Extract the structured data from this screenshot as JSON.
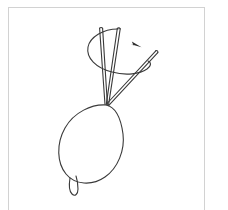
{
  "figure": {
    "title": "Hand-drawn line diagram of a looped cord with converging needles and a rotation arrow",
    "background_color": "#ffffff",
    "frame": {
      "name": "figure-border",
      "stroke_color": "#d2d2d2",
      "stroke_width": 1,
      "x": 8,
      "y": 7,
      "width": 197,
      "height": 210
    },
    "ink_color": "#3a3a3a",
    "ink_color_dark": "#2b2b2b",
    "stroke_width": 1.1,
    "elements": [
      {
        "name": "main-oval-loop",
        "type": "closed-curve",
        "description": "large tilted oval loop forming the body of the cord loop",
        "center_x": 92,
        "center_y": 142,
        "radius_x": 31,
        "radius_y": 41,
        "rotation_deg": 25
      },
      {
        "name": "small-tail-loop",
        "type": "closed-curve",
        "description": "small teardrop loop hanging below the main oval",
        "center_x": 74,
        "center_y": 186,
        "radius_x": 4,
        "radius_y": 8
      },
      {
        "name": "needle-rod-left",
        "type": "double-line-rod",
        "description": "leftmost slender rod rising from convergence point to upper area",
        "tip_x": 106,
        "tip_y": 104,
        "end_x": 101,
        "end_y": 28
      },
      {
        "name": "needle-rod-middle",
        "type": "double-line-rod",
        "description": "middle slender rod rising from convergence point, slightly right-leaning",
        "tip_x": 106,
        "tip_y": 104,
        "end_x": 119,
        "end_y": 28
      },
      {
        "name": "needle-rod-right",
        "type": "double-line-rod",
        "description": "right rod extending diagonally up and to the right with rounded tip",
        "tip_x": 106,
        "tip_y": 104,
        "end_x": 157,
        "end_y": 52
      },
      {
        "name": "rotation-ellipse-curve",
        "type": "open-curve",
        "description": "elliptical sweeping curve encircling the rods indicating rotation path",
        "center_x": 118,
        "center_y": 55,
        "radius_x": 32,
        "radius_y": 20,
        "rotation_deg": 18
      },
      {
        "name": "rotation-arrowhead",
        "type": "filled-triangle",
        "description": "small solid arrowhead on the rotation curve pointing down-right",
        "x": 133,
        "y": 42,
        "direction_deg": 28
      }
    ]
  }
}
